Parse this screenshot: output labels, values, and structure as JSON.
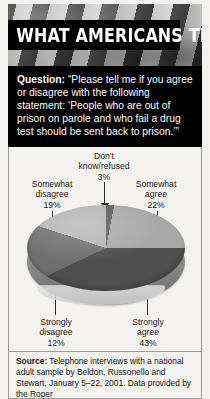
{
  "banner": {
    "title": "WHAT AMERICANS THINK",
    "photo_description": "american-flag-photo"
  },
  "question": {
    "label": "Question:",
    "text": " “Please tell me if you agree or disagree with the following statement: ‘People who are out of prison on parole and who fail a drug test should be sent back to prison.’”"
  },
  "source": {
    "label": "Source:",
    "text": " Telephone interviews with a national adult sample by Beldon, Russonello and Stewart, January 5–22, 2001. Data provided by the Roper"
  },
  "chart_data": {
    "type": "pie",
    "title": "",
    "subtitle": "",
    "style": "3d-pie",
    "legend": "labels-with-leader-lines",
    "grid": false,
    "categories": [
      "Don't know/refused",
      "Somewhat agree",
      "Strongly agree",
      "Strongly disagree",
      "Somewhat disagree"
    ],
    "values": [
      3,
      22,
      43,
      12,
      19
    ],
    "value_labels": [
      "3%",
      "22%",
      "43%",
      "12%",
      "19%"
    ],
    "unit": "percent",
    "total": 99,
    "colors": [
      "#5b5b5b",
      "#a8a8a8",
      "#4f4f4f",
      "#6f6f6f",
      "#b5b5b5"
    ],
    "slices": [
      {
        "label_line1": "Don't",
        "label_line2": "know/refused",
        "pct": "3%",
        "value": 3,
        "color": "#5b5b5b"
      },
      {
        "label_line1": "Somewhat",
        "label_line2": "agree",
        "pct": "22%",
        "value": 22,
        "color": "#a8a8a8"
      },
      {
        "label_line1": "Strongly",
        "label_line2": "agree",
        "pct": "43%",
        "value": 43,
        "color": "#4f4f4f"
      },
      {
        "label_line1": "Strongly",
        "label_line2": "disagree",
        "pct": "12%",
        "value": 12,
        "color": "#6f6f6f"
      },
      {
        "label_line1": "Somewhat",
        "label_line2": "disagree",
        "pct": "19%",
        "value": 19,
        "color": "#b5b5b5"
      }
    ]
  }
}
